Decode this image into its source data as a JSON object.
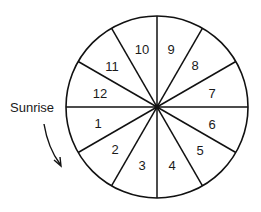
{
  "diagram": {
    "type": "sundial-wheel",
    "annotation_label": "Sunrise",
    "annotation_direction": "clockwise-arrow",
    "segments": [
      {
        "label": "1",
        "x": 98,
        "y": 128
      },
      {
        "label": "2",
        "x": 115,
        "y": 154
      },
      {
        "label": "3",
        "x": 142,
        "y": 170
      },
      {
        "label": "4",
        "x": 172,
        "y": 170
      },
      {
        "label": "5",
        "x": 200,
        "y": 155
      },
      {
        "label": "6",
        "x": 212,
        "y": 129
      },
      {
        "label": "7",
        "x": 212,
        "y": 98
      },
      {
        "label": "8",
        "x": 195,
        "y": 70
      },
      {
        "label": "9",
        "x": 171,
        "y": 54
      },
      {
        "label": "10",
        "x": 142,
        "y": 54
      },
      {
        "label": "11",
        "x": 112,
        "y": 71
      },
      {
        "label": "12",
        "x": 100,
        "y": 98
      }
    ]
  }
}
